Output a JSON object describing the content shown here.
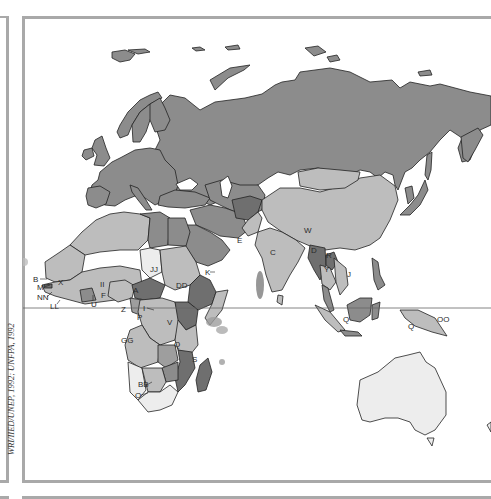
{
  "map": {
    "type": "choropleth",
    "region": "Europe, Africa, Asia and Oceania",
    "credit": "WRI/IIED/UNEP, 1992; UNFPA, 1992",
    "colors": {
      "background": "#ffffff",
      "frame": "#a9a9a9",
      "shade_dark": "#6f6f6f",
      "shade_mid_dark": "#8c8c8c",
      "shade_mid": "#9e9e9e",
      "shade_light": "#bdbdbd",
      "shade_lightest": "#ededed",
      "border": "#222222"
    },
    "labels": {
      "A": "A",
      "B": "B",
      "C": "C",
      "D": "D",
      "E": "E",
      "F": "F",
      "I": "I",
      "J": "J",
      "K": "K",
      "M": "M",
      "O": "O",
      "P": "P",
      "Q1": "Q",
      "Q2": "Q",
      "Q3": "Q",
      "R": "R",
      "S": "S",
      "U": "U",
      "V": "V",
      "W": "W",
      "X": "X",
      "Y": "Y",
      "Z": "Z",
      "BB": "BB",
      "DD": "DD",
      "GG": "GG",
      "II": "II",
      "JJ": "JJ",
      "LL": "LL",
      "NN": "NN",
      "OO": "OO"
    }
  }
}
